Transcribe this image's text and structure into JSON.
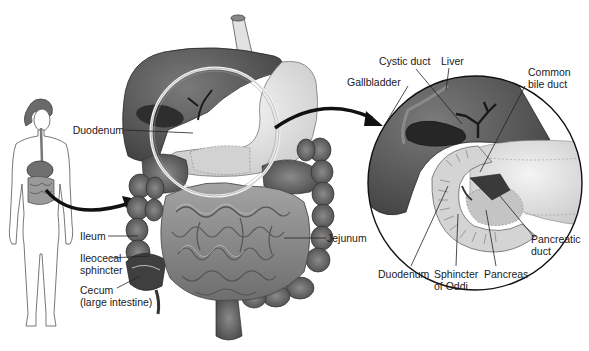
{
  "diagram": {
    "panels": {
      "figure": "Whole-body silhouette with digestive tract highlighted",
      "main": "Abdominal organs: liver, stomach, small and large intestine",
      "inset": "Magnified view of liver, gallbladder, duodenum and pancreas"
    }
  },
  "labels": {
    "main": {
      "duodenum": "Duodenum",
      "jejunum": "Jejunum",
      "ileum": "Ileum",
      "ileocecal_1": "Ileocecal",
      "ileocecal_2": "sphincter",
      "cecum_1": "Cecum",
      "cecum_2": "(large intestine)"
    },
    "inset": {
      "cystic_duct": "Cystic duct",
      "liver": "Liver",
      "gallbladder": "Gallbladder",
      "common_bile_1": "Common",
      "common_bile_2": "bile duct",
      "pancreatic_duct_1": "Pancreatic",
      "pancreatic_duct_2": "duct",
      "duodenum": "Duodenum",
      "sphincter_1": "Sphincter",
      "sphincter_2": "of Oddi",
      "pancreas": "Pancreas"
    }
  },
  "colors": {
    "ink": "#1a1a1a",
    "liver": "#5c5c5c",
    "liver_dark": "#3a3a3a",
    "stomach": "#e6e6e6",
    "intestine": "#8a8a8a",
    "colon": "#6a6a6a",
    "background": "#ffffff"
  }
}
